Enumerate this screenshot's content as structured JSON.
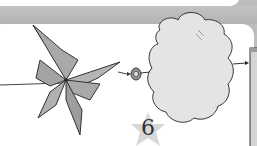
{
  "diagram": {
    "step_number": "6",
    "elements": [
      "pinwheel",
      "spool",
      "cloud",
      "side-panel"
    ],
    "colors": {
      "background_band": "#bdbdbd",
      "panel": "#ffffff",
      "pinwheel_fill": "#a9a9a9",
      "cloud_fill": "#e4e4e4",
      "star_fill": "#d8d8d8",
      "outline": "#333333"
    }
  }
}
